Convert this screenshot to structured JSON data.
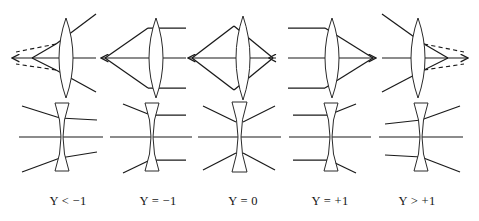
{
  "figure": {
    "background_color": "#ffffff",
    "stroke_color": "#1a1a1a",
    "width": 479,
    "height": 221,
    "rows": [
      {
        "row_name": "converging-lens-row",
        "lens_type": "biconvex",
        "axis_y": 58
      },
      {
        "row_name": "diverging-lens-row",
        "lens_type": "biconcave",
        "axis_y": 137
      }
    ],
    "panels": [
      {
        "index": 0,
        "label": "Y < −1",
        "label_x": 68,
        "center_x": 62,
        "convex": {
          "object_side": "right",
          "image_type": "virtual",
          "has_dashed_rays": true,
          "left_arrow": true,
          "right_arrow": false,
          "convergence_x": 18,
          "ray_slope_description": "rays enter from upper right and lower right, diverge after lens, back-extended dashed rays meet left of lens"
        },
        "concave": {
          "ray_style": "tilted-crossing",
          "has_dashed_rays": false
        }
      },
      {
        "index": 1,
        "label": "Y = −1",
        "label_x": 158,
        "center_x": 152,
        "convex": {
          "object_side": "right",
          "image_type": "real",
          "has_dashed_rays": false,
          "left_arrow": true,
          "right_arrow": false,
          "convergence_x": 103,
          "ray_slope_description": "horizontal rays from right converge to point at left focal plane"
        },
        "concave": {
          "ray_style": "horizontal-right-tilted-left",
          "has_dashed_rays": false
        }
      },
      {
        "index": 2,
        "label": "Y = 0",
        "label_x": 243,
        "center_x": 239,
        "convex": {
          "object_side": "both",
          "image_type": "real",
          "has_dashed_rays": false,
          "left_arrow": true,
          "right_arrow": true,
          "convergence_x": 190,
          "ray_slope_description": "symmetric double cone, conjugate points on both sides"
        },
        "concave": {
          "ray_style": "symmetric-x",
          "has_dashed_rays": false
        }
      },
      {
        "index": 3,
        "label": "Y = +1",
        "label_x": 330,
        "center_x": 328,
        "convex": {
          "object_side": "left",
          "image_type": "real",
          "has_dashed_rays": false,
          "left_arrow": false,
          "right_arrow": true,
          "convergence_x": 377,
          "ray_slope_description": "horizontal rays from left converge to point at right focal plane"
        },
        "concave": {
          "ray_style": "horizontal-left-tilted-right",
          "has_dashed_rays": false
        }
      },
      {
        "index": 4,
        "label": "Y > +1",
        "label_x": 417,
        "center_x": 414,
        "convex": {
          "object_side": "left",
          "image_type": "virtual",
          "has_dashed_rays": true,
          "left_arrow": false,
          "right_arrow": true,
          "convergence_x": 462,
          "ray_slope_description": "rays enter from upper left and lower left, diverge after lens, forward dashed rays meet right of lens"
        },
        "concave": {
          "ray_style": "tilted-crossing-mirrored",
          "has_dashed_rays": false
        }
      }
    ],
    "captions": [
      "Y < −1",
      "Y = −1",
      "Y = 0",
      "Y = +1",
      "Y > +1"
    ],
    "caption_y": 205
  }
}
